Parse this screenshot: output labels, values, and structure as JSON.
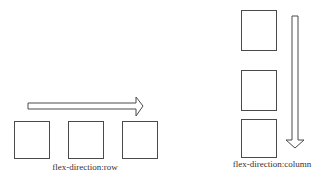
{
  "diagram": {
    "row": {
      "label": "flex-direction:row",
      "label_pos": {
        "x": 85,
        "y": 162
      },
      "boxes": [
        {
          "x": 14,
          "y": 121,
          "w": 35,
          "h": 37
        },
        {
          "x": 68,
          "y": 121,
          "w": 35,
          "h": 37
        },
        {
          "x": 122,
          "y": 121,
          "w": 35,
          "h": 37
        }
      ],
      "arrow": {
        "direction": "right",
        "shaft": {
          "x1": 28,
          "x2": 136,
          "y1": 103,
          "y2": 109
        },
        "tip": {
          "x": 143,
          "y": 106
        },
        "head_y": [
          97,
          116
        ]
      }
    },
    "column": {
      "label": "flex-direction:column",
      "label_pos": {
        "x": 272,
        "y": 159
      },
      "boxes": [
        {
          "x": 241,
          "y": 10,
          "w": 35,
          "h": 40
        },
        {
          "x": 241,
          "y": 70,
          "w": 35,
          "h": 40
        },
        {
          "x": 241,
          "y": 119,
          "w": 35,
          "h": 38
        }
      ],
      "arrow": {
        "direction": "down",
        "shaft": {
          "x1": 292,
          "x2": 298,
          "y1": 16,
          "y2": 140
        },
        "tip": {
          "x": 295,
          "y": 148
        },
        "head_x": [
          286,
          304
        ]
      }
    },
    "stroke_color": "#4a4a4a"
  }
}
